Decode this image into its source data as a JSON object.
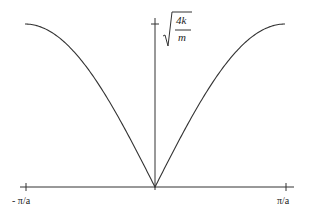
{
  "chart_data": {
    "type": "line",
    "title": "",
    "xlabel": "",
    "ylabel": "",
    "x_ticks": [
      "- π/a",
      "π/a"
    ],
    "y_annotation": {
      "max_label_numerator": "4k",
      "max_label_denominator": "m",
      "form": "sqrt(4k/m)"
    },
    "function": "omega = sqrt(4k/m) * |sin(k a / 2)|",
    "x_range": [
      "-π/a",
      "π/a"
    ],
    "y_range": [
      0,
      "sqrt(4k/m)"
    ],
    "series": [
      {
        "name": "dispersion",
        "x": [
          -1.0,
          -0.75,
          -0.5,
          -0.25,
          0.0,
          0.25,
          0.5,
          0.75,
          1.0
        ],
        "values": [
          1.0,
          0.924,
          0.707,
          0.383,
          0.0,
          0.383,
          0.707,
          0.924,
          1.0
        ]
      }
    ],
    "grid": false,
    "legend": "none"
  },
  "labels": {
    "x_min": "- π/a",
    "x_max": "π/a",
    "y_num": "4k",
    "y_den": "m"
  },
  "colors": {
    "curve": "#333333",
    "axis": "#333333"
  }
}
